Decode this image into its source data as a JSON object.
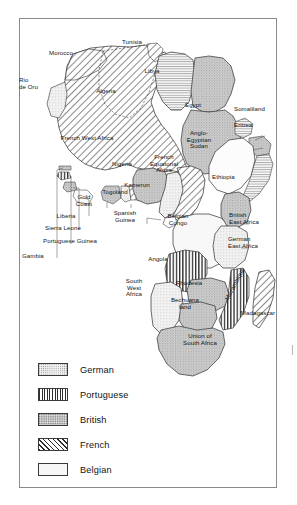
{
  "figure": {
    "frame": {
      "border_color": "#8a8a8a"
    }
  },
  "map": {
    "name": "africa-colonial-map",
    "regions": [
      {
        "name": "morocco",
        "label": "Morocco",
        "power": "French",
        "x": 60,
        "y": 54
      },
      {
        "name": "tunisia",
        "label": "Tunisia",
        "power": "French",
        "x": 132,
        "y": 43
      },
      {
        "name": "rio-de-oro",
        "label": "Rio\nde Oro",
        "power": "Spanish",
        "x": 28,
        "y": 84
      },
      {
        "name": "algeria",
        "label": "Algeria",
        "power": "French",
        "x": 106,
        "y": 92
      },
      {
        "name": "libya",
        "label": "Libya",
        "power": "Italian",
        "x": 152,
        "y": 72
      },
      {
        "name": "egypt",
        "label": "Egypt",
        "power": "British",
        "x": 193,
        "y": 106
      },
      {
        "name": "somaliland",
        "label": "Somaliland",
        "power": "British",
        "x": 256,
        "y": 110
      },
      {
        "name": "eritrea",
        "label": "Eritrea",
        "power": "Italian",
        "x": 253,
        "y": 126
      },
      {
        "name": "french-west-africa",
        "label": "French West Africa",
        "power": "French",
        "x": 87,
        "y": 138
      },
      {
        "name": "anglo-egyptian-sudan",
        "label": "Anglo-\nEgyptian\nSudan",
        "power": "British",
        "x": 199,
        "y": 140
      },
      {
        "name": "nigeria",
        "label": "Nigeria",
        "power": "British",
        "x": 122,
        "y": 164
      },
      {
        "name": "french-equatorial-africa",
        "label": "French\nEquatorial\nAfrica",
        "power": "French",
        "x": 163,
        "y": 163
      },
      {
        "name": "ethiopia",
        "label": "Ethiopia",
        "power": "Independent",
        "x": 228,
        "y": 177
      },
      {
        "name": "kamerun",
        "label": "Kamerun",
        "power": "German",
        "x": 137,
        "y": 185
      },
      {
        "name": "togoland",
        "label": "Togoland",
        "power": "German",
        "x": 114,
        "y": 192
      },
      {
        "name": "gold-coast",
        "label": "Gold\nCoast",
        "power": "British",
        "x": 83,
        "y": 198
      },
      {
        "name": "liberia",
        "label": "Liberia",
        "power": "Independent",
        "x": 65,
        "y": 216
      },
      {
        "name": "spanish-guinea",
        "label": "Spanish\nGuinea",
        "power": "Spanish",
        "x": 124,
        "y": 214
      },
      {
        "name": "sierra-leone",
        "label": "Sierra Leone",
        "power": "British",
        "x": 62,
        "y": 228
      },
      {
        "name": "belgian-congo",
        "label": "Belgian\nCongo",
        "power": "Belgian",
        "x": 177,
        "y": 217
      },
      {
        "name": "british-east-africa",
        "label": "British\nEast Africa",
        "power": "British",
        "x": 250,
        "y": 216
      },
      {
        "name": "portuguese-guinea",
        "label": "Portuguese Guinea",
        "power": "Portuguese",
        "x": 70,
        "y": 241
      },
      {
        "name": "german-east-africa",
        "label": "German\nEast Africa",
        "power": "German",
        "x": 248,
        "y": 239
      },
      {
        "name": "gambia",
        "label": "Gambia",
        "power": "British",
        "x": 37,
        "y": 256
      },
      {
        "name": "angola",
        "label": "Angola",
        "power": "Portuguese",
        "x": 158,
        "y": 259
      },
      {
        "name": "mozambique",
        "label": "Mozambique",
        "power": "Portuguese",
        "x": 235,
        "y": 286
      },
      {
        "name": "south-west-africa",
        "label": "South\nWest\nAfrica",
        "power": "German",
        "x": 134,
        "y": 288
      },
      {
        "name": "rhodesia",
        "label": "Rhodesia",
        "power": "British",
        "x": 187,
        "y": 283
      },
      {
        "name": "bechuanaland",
        "label": "Bechuana\nland",
        "power": "British",
        "x": 184,
        "y": 301
      },
      {
        "name": "madagascar",
        "label": "Madagascar",
        "power": "French",
        "x": 258,
        "y": 312
      },
      {
        "name": "union-of-south-africa",
        "label": "Union of\nSouth Africa",
        "power": "British",
        "x": 199,
        "y": 337
      }
    ]
  },
  "legend": {
    "name": "colonial-power-legend",
    "entries": [
      {
        "key": "german",
        "label": "German",
        "pattern": "light-stipple"
      },
      {
        "key": "portuguese",
        "label": "Portuguese",
        "pattern": "vertical-stripes"
      },
      {
        "key": "british",
        "label": "British",
        "pattern": "gray-stipple"
      },
      {
        "key": "french",
        "label": "French",
        "pattern": "diagonal-hatch"
      },
      {
        "key": "belgian",
        "label": "Belgian",
        "pattern": "plain-white"
      }
    ]
  },
  "colors": {
    "frame": "#8a8a8a",
    "coastline": "#2b2b2b",
    "border": "#444444",
    "text": "#141414",
    "british_fill": "#d6d6d6",
    "german_fill": "#f2f2f2",
    "belgian_fill": "#f7f7f7"
  }
}
